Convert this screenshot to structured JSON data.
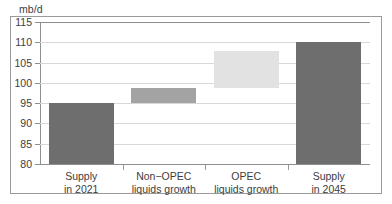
{
  "chart_data": {
    "type": "bar",
    "title": "",
    "subtitle": "",
    "xlabel": "",
    "ylabel": "mb/d",
    "unit_caption": "mb/d",
    "ylim": [
      80,
      115
    ],
    "ytick_values": [
      80,
      85,
      90,
      95,
      100,
      105,
      110,
      115
    ],
    "ytick_labels": [
      "80",
      "85",
      "90",
      "95",
      "100",
      "105",
      "110",
      "115"
    ],
    "grid": true,
    "legend": "none",
    "categories": [
      "Supply\nin 2021",
      "Non−OPEC\nliquids growth",
      "OPEC\nliquids growth",
      "Supply\nin 2045"
    ],
    "waterfall": true,
    "bars": [
      {
        "label": "Supply\nin 2021",
        "base": 80,
        "top": 95,
        "value": 95,
        "color": "#6e6e6e"
      },
      {
        "label": "Non−OPEC\nliquids growth",
        "base": 95,
        "top": 98.7,
        "value": 3.7,
        "color": "#a3a3a3"
      },
      {
        "label": "OPEC\nliquids growth",
        "base": 98.7,
        "top": 107.9,
        "value": 9.2,
        "color": "#e2e2e2"
      },
      {
        "label": "Supply\nin 2045",
        "base": 80,
        "top": 110,
        "value": 110,
        "color": "#6e6e6e"
      }
    ],
    "values": [
      95,
      3.7,
      9.2,
      110
    ],
    "colors": {
      "bar_dark": "#6e6e6e",
      "bar_mid": "#a3a3a3",
      "bar_light": "#e2e2e2",
      "gridline": "#d8d8d8",
      "axis": "#8f8f8f",
      "frame": "#9a9a9a",
      "text": "#3d3d3d",
      "background": "#ffffff"
    }
  }
}
